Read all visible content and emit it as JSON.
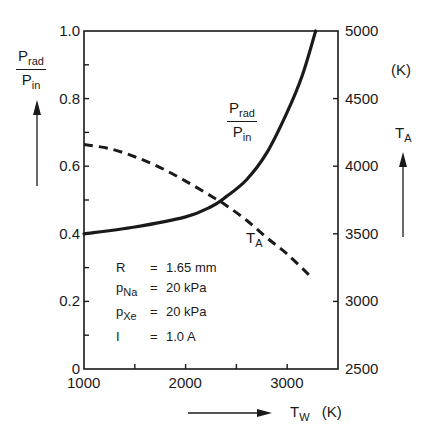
{
  "chart_data": {
    "type": "line",
    "title": "",
    "xlabel": "T_W (K)",
    "ylabel_left": "P_rad / P_in",
    "ylabel_right": "T_A (K)",
    "xlim": [
      1000,
      3500
    ],
    "ylim_left": [
      0,
      1.0
    ],
    "ylim_right": [
      2500,
      5000
    ],
    "x_ticks": [
      "1000",
      "2000",
      "3000"
    ],
    "x_minor_ticks": [
      1500,
      2000,
      2500,
      3000
    ],
    "y_left_ticks": [
      "0",
      "0.2",
      "0.4",
      "0.6",
      "0.8",
      "1.0"
    ],
    "y_right_ticks": [
      "2500",
      "3000",
      "3500",
      "4000",
      "4500",
      "5000"
    ],
    "grid": false,
    "series": [
      {
        "name": "P_rad/P_in",
        "axis": "left",
        "style": "solid",
        "x": [
          1000,
          1500,
          2000,
          2250,
          2400,
          2600,
          2800,
          3000,
          3150,
          3280
        ],
        "y": [
          0.4,
          0.42,
          0.45,
          0.48,
          0.51,
          0.56,
          0.64,
          0.76,
          0.87,
          1.0
        ]
      },
      {
        "name": "T_A",
        "axis": "right",
        "style": "dashed",
        "x": [
          1000,
          1250,
          1500,
          1750,
          2000,
          2250,
          2400,
          2600,
          2800,
          3000,
          3250
        ],
        "y": [
          4160,
          4130,
          4070,
          3990,
          3890,
          3780,
          3710,
          3600,
          3470,
          3350,
          3170
        ]
      }
    ],
    "annotations": [
      {
        "text": "P_rad/P_in",
        "near_series": "P_rad/P_in"
      },
      {
        "text": "T_A",
        "near_series": "T_A"
      }
    ],
    "parameters": [
      {
        "symbol": "R",
        "sub": "",
        "value": "1.65 mm"
      },
      {
        "symbol": "p",
        "sub": "Na",
        "value": "20  kPa"
      },
      {
        "symbol": "p",
        "sub": "Xe",
        "value": "20  kPa"
      },
      {
        "symbol": "I",
        "sub": "",
        "value": "1.0  A"
      }
    ]
  },
  "labels": {
    "left_axis_num": "P",
    "left_axis_num_sub": "rad",
    "left_axis_den": "P",
    "left_axis_den_sub": "in",
    "curve_num": "P",
    "curve_num_sub": "rad",
    "curve_den": "P",
    "curve_den_sub": "in",
    "ta_curve": "T",
    "ta_curve_sub": "A",
    "right_unit": "(K)",
    "right_axis": "T",
    "right_axis_sub": "A",
    "x_axis": "T",
    "x_axis_sub": "W",
    "x_unit": "(K)"
  }
}
